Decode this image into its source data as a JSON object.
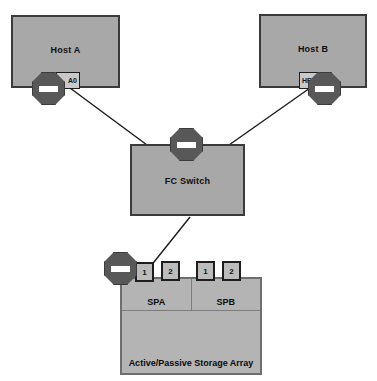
{
  "diagram": {
    "colors": {
      "node_fill": "#a8a8a8",
      "node_border": "#3a3a3a",
      "array_fill": "#b4b4b4",
      "array_border": "#6e6e6e",
      "octagon_fill": "#585858",
      "octagon_bar": "#ffffff",
      "port_fill": "#bcbcbc",
      "line": "#1a1a1a",
      "background": "#ffffff"
    },
    "hosts": [
      {
        "id": "host-a",
        "label": "Host A",
        "hba_label": "A0"
      },
      {
        "id": "host-b",
        "label": "Host B",
        "hba_label": "HB"
      }
    ],
    "switch": {
      "label": "FC Switch"
    },
    "storage": {
      "label": "Active/Passive Storage Array",
      "processors": [
        {
          "name": "SPA",
          "ports": [
            "1",
            "2"
          ]
        },
        {
          "name": "SPB",
          "ports": [
            "1",
            "2"
          ]
        }
      ]
    },
    "markers": [
      {
        "id": "oct-host-a",
        "icon": "blocked-path-octagon-icon"
      },
      {
        "id": "oct-host-b",
        "icon": "blocked-path-octagon-icon"
      },
      {
        "id": "oct-switch",
        "icon": "blocked-path-octagon-icon"
      },
      {
        "id": "oct-array",
        "icon": "blocked-path-octagon-icon"
      }
    ],
    "links": [
      {
        "from": "host-a",
        "to": "fc-switch"
      },
      {
        "from": "host-b",
        "to": "fc-switch"
      },
      {
        "from": "fc-switch",
        "to": "storage-spa-port-1"
      }
    ]
  }
}
